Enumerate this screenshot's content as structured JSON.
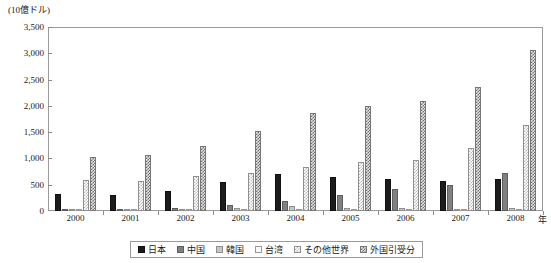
{
  "axes": {
    "unit_label": "(10億ドル)",
    "x_unit": "年",
    "y_ticks": [
      "3,500",
      "3,000",
      "2,500",
      "2,000",
      "1,500",
      "1,000",
      "500",
      "0"
    ],
    "x_ticks": [
      "2000",
      "2001",
      "2002",
      "2003",
      "2004",
      "2005",
      "2006",
      "2007",
      "2008"
    ]
  },
  "legend": {
    "items": [
      {
        "label": "日本",
        "key": "japan",
        "swatch": "solid-black-swatch"
      },
      {
        "label": "中国",
        "key": "china",
        "swatch": "solid-gray-swatch"
      },
      {
        "label": "韓国",
        "key": "korea",
        "swatch": "light-gray-swatch"
      },
      {
        "label": "台湾",
        "key": "taiwan",
        "swatch": "white-swatch"
      },
      {
        "label": "その他世界",
        "key": "row",
        "swatch": "light-hatch-swatch"
      },
      {
        "label": "外国引受分",
        "key": "foreign",
        "swatch": "dark-hatch-swatch"
      }
    ]
  },
  "chart_data": {
    "type": "bar",
    "title": "",
    "xlabel": "年",
    "ylabel": "(10億ドル)",
    "ylim": [
      0,
      3500
    ],
    "ytick_step": 500,
    "grid": false,
    "legend_position": "bottom",
    "categories": [
      "2000",
      "2001",
      "2002",
      "2003",
      "2004",
      "2005",
      "2006",
      "2007",
      "2008"
    ],
    "series": [
      {
        "name": "日本",
        "color": "#1c1c1c",
        "values": [
          330,
          300,
          390,
          560,
          700,
          650,
          600,
          570,
          610
        ]
      },
      {
        "name": "中国",
        "color": "#808080",
        "values": [
          20,
          25,
          50,
          110,
          200,
          300,
          420,
          500,
          730
        ]
      },
      {
        "name": "韓国",
        "color": "#c6c6c6",
        "values": [
          15,
          18,
          30,
          60,
          90,
          60,
          60,
          40,
          60
        ]
      },
      {
        "name": "台湾",
        "color": "#fafafa",
        "values": [
          10,
          12,
          20,
          30,
          40,
          35,
          35,
          30,
          40
        ]
      },
      {
        "name": "その他世界",
        "color": "#b9b9b9",
        "values": [
          590,
          580,
          670,
          720,
          830,
          930,
          970,
          1200,
          1630
        ]
      },
      {
        "name": "外国引受分",
        "color": "#6f6f6f",
        "values": [
          1030,
          1060,
          1240,
          1520,
          1860,
          1990,
          2100,
          2350,
          3060
        ]
      }
    ]
  }
}
